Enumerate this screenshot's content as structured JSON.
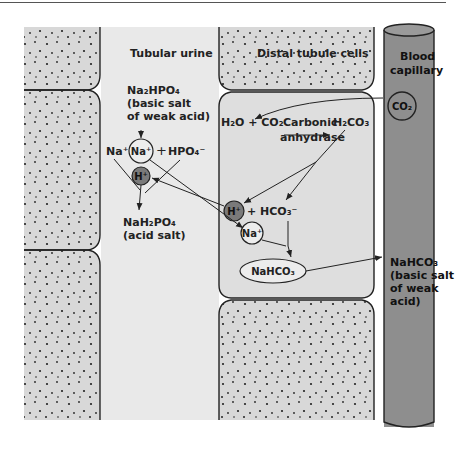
{
  "figure": {
    "regions": {
      "tubular_urine": "Tubular urine",
      "distal_tubule_cells": "Distal tubule cells",
      "blood_capillary_line1": "Blood",
      "blood_capillary_line2": "capillary"
    },
    "urine": {
      "na2hpo4": "Na₂HPO₄",
      "na2hpo4_desc1": "(basic salt",
      "na2hpo4_desc2": "of weak acid)",
      "na_plus_left": "Na⁺",
      "na_plus_circle": "Na⁺",
      "plus": "+",
      "hpo4": "HPO₄⁻",
      "h_plus": "H⁺",
      "nah2po4": "NaH₂PO₄",
      "nah2po4_desc": "(acid salt)"
    },
    "cell": {
      "h2o_co2": "H₂O + CO₂",
      "carbonic": "Carbonic",
      "anhydrase": "anhydrase",
      "h2co3": "H₂CO₃",
      "h_plus": "H⁺",
      "plus_hco3": "+ HCO₃⁻",
      "na_plus": "Na⁺",
      "nahco3": "NaHCO₃"
    },
    "blood": {
      "co2": "CO₂",
      "nahco3": "NaHCO₃",
      "nahco3_desc1": "(basic salt",
      "nahco3_desc2": "of weak",
      "nahco3_desc3": "acid)"
    },
    "colors": {
      "cell_fill": "#dcdcdc",
      "urine_fill": "#e6e6e6",
      "capillary_fill": "#8c8c8c",
      "ion_circle_fill": "#7a7a7a",
      "stroke": "#222222"
    }
  }
}
